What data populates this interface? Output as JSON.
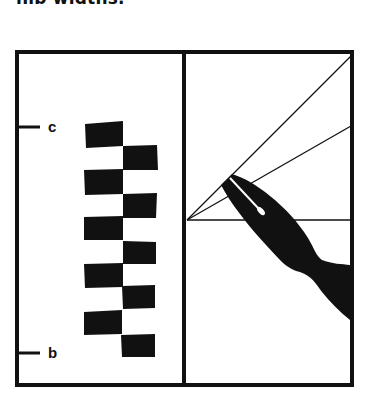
{
  "caption": {
    "text": "nib widths."
  },
  "figure": {
    "left_panel": {
      "description": "stacked nib-width squares",
      "top_marker_label": "c",
      "bottom_marker_label": "b",
      "block_count": 10
    },
    "right_panel": {
      "description": "pen nib held at angle with guide lines",
      "guide_line_count": 3
    }
  },
  "colors": {
    "ink": "#111111",
    "background": "#ffffff"
  }
}
